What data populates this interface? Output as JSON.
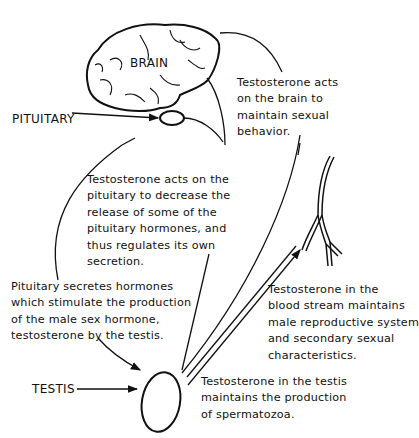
{
  "diagram": {
    "labels": {
      "brain": "BRAIN",
      "pituitary": "PITUITARY",
      "testis": "TESTIS"
    },
    "annotations": {
      "brain_action": [
        "Testosterone acts",
        "on the brain to",
        "maintain sexual",
        "behavior."
      ],
      "pituitary_feedback": [
        "Testosterone acts on the",
        "pituitary to decrease the",
        "release of some of the",
        "pituitary hormones, and",
        "thus regulates its own",
        "secretion."
      ],
      "pituitary_secretes": [
        "Pituitary secretes hormones",
        "which stimulate the production",
        "of the male sex hormone,",
        "testosterone by the testis."
      ],
      "blood_stream": [
        "Testosterone in the",
        "blood stream maintains",
        "male reproductive system",
        "and secondary sexual",
        "characteristics."
      ],
      "testis_action": [
        "Testosterone in the testis",
        "maintains the production",
        "of spermatozoa."
      ]
    },
    "icons": [
      "brain-icon",
      "pituitary-gland-icon",
      "testis-icon",
      "blood-vessel-icon"
    ],
    "colors": {
      "line": "#111111",
      "background": "#ffffff"
    }
  }
}
